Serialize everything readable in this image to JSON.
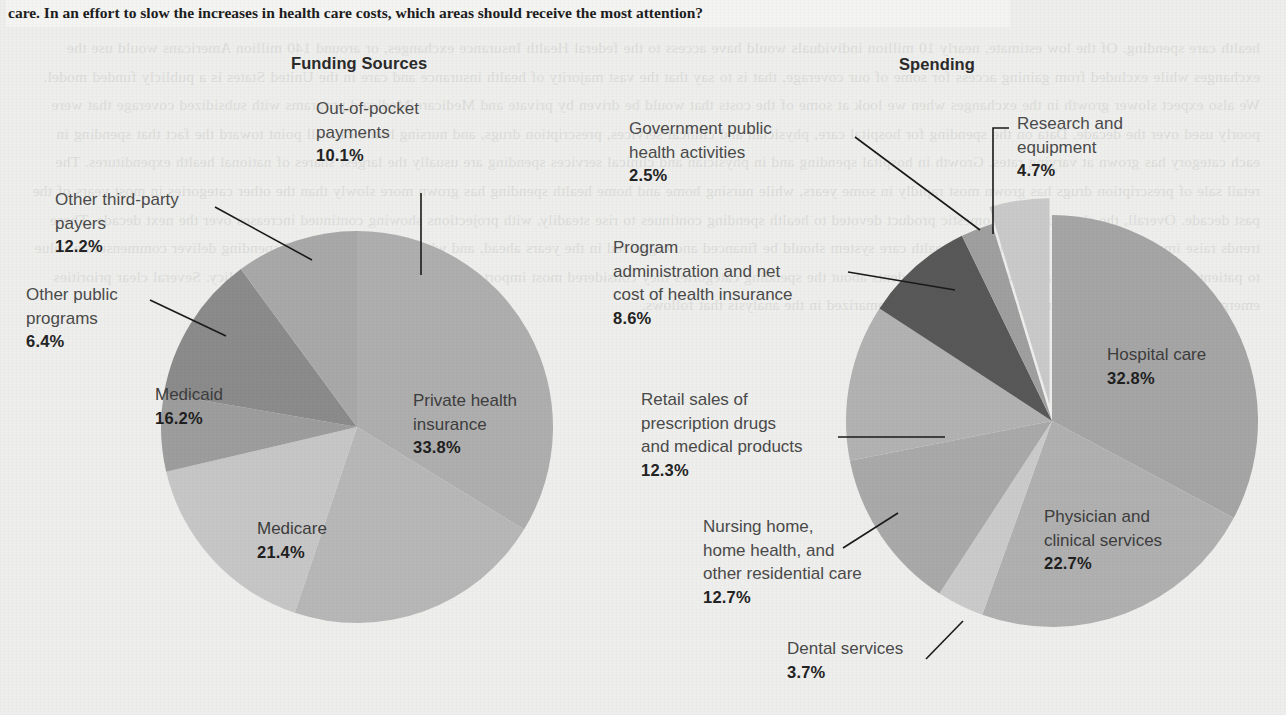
{
  "headline": "care. In an effort to slow the increases in health care costs, which areas should receive the most attention?",
  "bleed_text": "health care spending. Of the low estimate, nearly 10 million individuals would have access to the federal Health Insurance exchanges, or around 140 million Americans would use the exchanges while excluded from gaining access for some of our coverage, that is to say that the vast majority of health insurance and care in the United States is a publicly funded model. We also expect slower growth in the exchanges when we look at some of the costs that would be driven by private and Medicare/Medicaid programs with subsidized coverage that were poorly used over the decade. Data on the spending for hospital care, physician and clinical services, prescription drugs, and nursing home care all point toward the fact that spending in each category has grown at varying rates. Growth in hospital spending and in physician and clinical services spending are usually the largest shares of national health expenditures. The retail sale of prescription drugs has grown most rapidly in some years, while nursing home and home health spending has grown more slowly than the other categories in most years of the past decade. Overall, the share of gross domestic product devoted to health spending continues to rise steadily, with projections showing continued increases over the next decade. These trends raise important questions about how the health care system should be financed and organized in the years ahead, and whether current levels of spending deliver commensurate value to patients and to the public at large. We asked respondents about the spending categories they considered most important to address as a matter of public policy. Several clear priorities emerged from their responses, and those priorities are summarized in the analysis that follows.",
  "charts": {
    "left": {
      "title": "Funding Sources",
      "center": {
        "x": 357,
        "y": 427
      },
      "radius": 196,
      "slices": [
        {
          "name": "Private health insurance",
          "value": 33.8,
          "label": "Private health insurance",
          "pct": "33.8%",
          "color": "#aeaeae"
        },
        {
          "name": "Medicare",
          "value": 21.4,
          "label": "Medicare",
          "pct": "21.4%",
          "color": "#b7b7b7"
        },
        {
          "name": "Medicaid",
          "value": 16.2,
          "label": "Medicaid",
          "pct": "16.2%",
          "color": "#c6c6c6"
        },
        {
          "name": "Other public programs",
          "value": 6.4,
          "label": "Other public programs",
          "pct": "6.4%",
          "color": "#9d9d9d"
        },
        {
          "name": "Other third-party payers",
          "value": 12.2,
          "label": "Other third-party payers",
          "pct": "12.2%",
          "color": "#8b8b8b"
        },
        {
          "name": "Out-of-pocket payments",
          "value": 10.1,
          "label": "Out-of-pocket payments",
          "pct": "10.1%",
          "color": "#a8a8a8"
        }
      ]
    },
    "right": {
      "title": "Spending",
      "center": {
        "x": 1052,
        "y": 421
      },
      "radius": 206,
      "slices": [
        {
          "name": "Hospital care",
          "value": 32.8,
          "label": "Hospital care",
          "pct": "32.8%",
          "color": "#a5a5a5"
        },
        {
          "name": "Physician and clinical services",
          "value": 22.7,
          "label": "Physician and clinical services",
          "pct": "22.7%",
          "color": "#b0b0b0"
        },
        {
          "name": "Dental services",
          "value": 3.7,
          "label": "Dental services",
          "pct": "3.7%",
          "color": "#cacaca"
        },
        {
          "name": "Nursing home, home health, and other residential care",
          "value": 12.7,
          "label": "Nursing home, home health, and other residential care",
          "pct": "12.7%",
          "color": "#a9a9a9"
        },
        {
          "name": "Retail sales of prescription drugs and medical products",
          "value": 12.3,
          "label": "Retail sales of prescription drugs and medical products",
          "pct": "12.3%",
          "color": "#b2b2b2"
        },
        {
          "name": "Program administration and net cost of health insurance",
          "value": 8.6,
          "label": "Program administration and net cost of health insurance",
          "pct": "8.6%",
          "color": "#585858"
        },
        {
          "name": "Government public health activities",
          "value": 2.5,
          "label": "Government public health activities",
          "pct": "2.5%",
          "color": "#9f9f9f"
        },
        {
          "name": "Research and equipment",
          "value": 4.7,
          "label": "Research and equipment",
          "pct": "4.7%",
          "color": "#c9c9c9"
        }
      ]
    }
  },
  "labels": {
    "l_outofpocket": {
      "l1": "Out-of-pocket",
      "l2": "payments",
      "pct": "10.1%"
    },
    "l_thirdparty": {
      "l1": "Other third-party",
      "l2": "payers",
      "pct": "12.2%"
    },
    "l_otherpublic": {
      "l1": "Other public",
      "l2": "programs",
      "pct": "6.4%"
    },
    "l_medicaid": {
      "l1": "Medicaid",
      "pct": "16.2%"
    },
    "l_medicare": {
      "l1": "Medicare",
      "pct": "21.4%"
    },
    "l_private": {
      "l1": "Private health",
      "l2": "insurance",
      "pct": "33.8%"
    },
    "r_govpublic": {
      "l1": "Government public",
      "l2": "health activities",
      "pct": "2.5%"
    },
    "r_progadmin": {
      "l1": "Program",
      "l2": "administration and net",
      "l3": "cost of health insurance",
      "pct": "8.6%"
    },
    "r_retail": {
      "l1": "Retail sales of",
      "l2": "prescription drugs",
      "l3": "and medical products",
      "pct": "12.3%"
    },
    "r_nursing": {
      "l1": "Nursing home,",
      "l2": "home health, and",
      "l3": "other residential care",
      "pct": "12.7%"
    },
    "r_dental": {
      "l1": "Dental services",
      "pct": "3.7%"
    },
    "r_research": {
      "l1": "Research and",
      "l2": "equipment",
      "pct": "4.7%"
    },
    "r_hospital": {
      "l1": "Hospital care",
      "pct": "32.8%"
    },
    "r_physician": {
      "l1": "Physician and",
      "l2": "clinical services",
      "pct": "22.7%"
    }
  },
  "chart_data": [
    {
      "type": "pie",
      "title": "Funding Sources",
      "categories": [
        "Private health insurance",
        "Medicare",
        "Medicaid",
        "Other public programs",
        "Other third-party payers",
        "Out-of-pocket payments"
      ],
      "values": [
        33.8,
        21.4,
        16.2,
        6.4,
        12.2,
        10.1
      ],
      "unit": "percent",
      "legend": "labels-outside-and-inside",
      "grid": false
    },
    {
      "type": "pie",
      "title": "Spending",
      "categories": [
        "Hospital care",
        "Physician and clinical services",
        "Dental services",
        "Nursing home, home health, and other residential care",
        "Retail sales of prescription drugs and medical products",
        "Program administration and net cost of health insurance",
        "Government public health activities",
        "Research and equipment"
      ],
      "values": [
        32.8,
        22.7,
        3.7,
        12.7,
        12.3,
        8.6,
        2.5,
        4.7
      ],
      "unit": "percent",
      "legend": "labels-outside-and-inside",
      "grid": false
    }
  ]
}
